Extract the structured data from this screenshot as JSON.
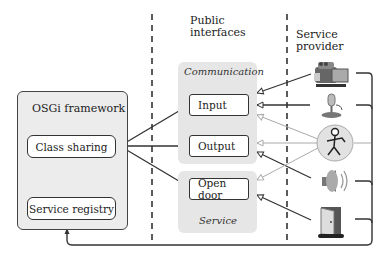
{
  "headings": {
    "public_interfaces": [
      "Public",
      "interfaces"
    ],
    "service_provider": "Service provider"
  },
  "framework": {
    "title": "OSGi framework",
    "class_sharing": "Class sharing",
    "service_registry": "Service registry"
  },
  "interfaces": {
    "communication_group": {
      "title": "Communication",
      "items": [
        "Input",
        "Output"
      ]
    },
    "service_group": {
      "title": "Service",
      "items": [
        "Open door"
      ]
    }
  },
  "providers": [
    {
      "icon": "camcorder-icon"
    },
    {
      "icon": "microphone-icon"
    },
    {
      "icon": "person-icon"
    },
    {
      "icon": "speaker-icon"
    },
    {
      "icon": "door-icon"
    }
  ],
  "colors": {
    "line": "#333333",
    "group_fill": "#e6e6e6",
    "light_arrow": "#aaaaaa"
  }
}
